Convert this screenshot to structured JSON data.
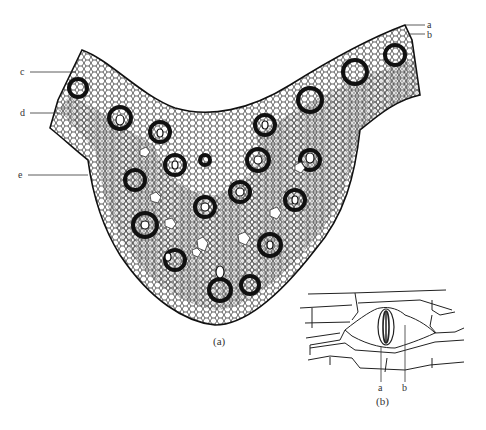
{
  "figure": {
    "panel_a": {
      "caption": "(a)",
      "subject": "leaf midrib cross-section with vascular bundles",
      "labels": [
        {
          "id": "a",
          "text": "a"
        },
        {
          "id": "b",
          "text": "b"
        },
        {
          "id": "c",
          "text": "c"
        },
        {
          "id": "d",
          "text": "d"
        },
        {
          "id": "e",
          "text": "e"
        }
      ]
    },
    "panel_b": {
      "caption": "(b)",
      "subject": "epidermis with stoma",
      "labels": [
        {
          "id": "a",
          "text": "a"
        },
        {
          "id": "b",
          "text": "b"
        }
      ]
    }
  },
  "colors": {
    "ink": "#222222",
    "background": "#ffffff"
  }
}
